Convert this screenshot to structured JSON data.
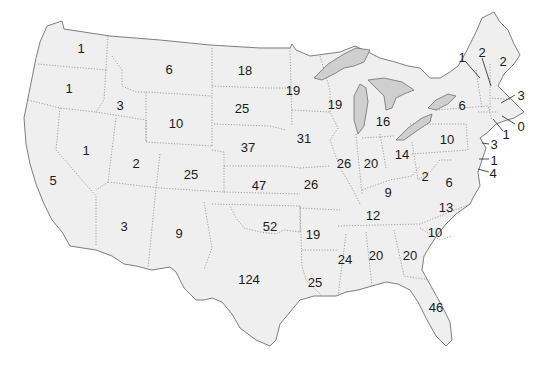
{
  "map": {
    "type": "us-states-count-map",
    "background": "#ffffff",
    "land_color": "#efefef",
    "lake_color": "#cfcfcf",
    "labels": [
      {
        "state": "WA",
        "value": "1",
        "x": 81,
        "y": 48
      },
      {
        "state": "OR",
        "value": "1",
        "x": 69,
        "y": 88
      },
      {
        "state": "CA",
        "value": "5",
        "x": 53,
        "y": 180
      },
      {
        "state": "NV",
        "value": "1",
        "x": 86,
        "y": 150
      },
      {
        "state": "ID",
        "value": "3",
        "x": 120,
        "y": 105
      },
      {
        "state": "MT",
        "value": "6",
        "x": 169,
        "y": 69
      },
      {
        "state": "WY",
        "value": "10",
        "x": 176,
        "y": 123
      },
      {
        "state": "UT",
        "value": "2",
        "x": 136,
        "y": 163
      },
      {
        "state": "AZ",
        "value": "3",
        "x": 124,
        "y": 226
      },
      {
        "state": "CO",
        "value": "25",
        "x": 191,
        "y": 174
      },
      {
        "state": "NM",
        "value": "9",
        "x": 179,
        "y": 233
      },
      {
        "state": "ND",
        "value": "18",
        "x": 245,
        "y": 70
      },
      {
        "state": "SD",
        "value": "25",
        "x": 242,
        "y": 108
      },
      {
        "state": "NE",
        "value": "37",
        "x": 248,
        "y": 147
      },
      {
        "state": "KS",
        "value": "47",
        "x": 259,
        "y": 185
      },
      {
        "state": "OK",
        "value": "52",
        "x": 270,
        "y": 226
      },
      {
        "state": "TX",
        "value": "124",
        "x": 249,
        "y": 279
      },
      {
        "state": "MN",
        "value": "19",
        "x": 293,
        "y": 90
      },
      {
        "state": "IA",
        "value": "31",
        "x": 304,
        "y": 138
      },
      {
        "state": "MO",
        "value": "26",
        "x": 311,
        "y": 184
      },
      {
        "state": "AR",
        "value": "19",
        "x": 313,
        "y": 234
      },
      {
        "state": "LA",
        "value": "25",
        "x": 315,
        "y": 282
      },
      {
        "state": "WI",
        "value": "19",
        "x": 335,
        "y": 104
      },
      {
        "state": "IL",
        "value": "26",
        "x": 344,
        "y": 163
      },
      {
        "state": "MI",
        "value": "16",
        "x": 383,
        "y": 121
      },
      {
        "state": "IN",
        "value": "20",
        "x": 371,
        "y": 163
      },
      {
        "state": "OH",
        "value": "14",
        "x": 402,
        "y": 154
      },
      {
        "state": "KY",
        "value": "9",
        "x": 388,
        "y": 192
      },
      {
        "state": "TN",
        "value": "12",
        "x": 373,
        "y": 215
      },
      {
        "state": "MS",
        "value": "24",
        "x": 345,
        "y": 259
      },
      {
        "state": "AL",
        "value": "20",
        "x": 376,
        "y": 255
      },
      {
        "state": "GA",
        "value": "20",
        "x": 410,
        "y": 255
      },
      {
        "state": "FL",
        "value": "46",
        "x": 436,
        "y": 307
      },
      {
        "state": "SC",
        "value": "10",
        "x": 435,
        "y": 232
      },
      {
        "state": "NC",
        "value": "13",
        "x": 446,
        "y": 207
      },
      {
        "state": "VA",
        "value": "6",
        "x": 449,
        "y": 182
      },
      {
        "state": "WV",
        "value": "2",
        "x": 425,
        "y": 176
      },
      {
        "state": "PA",
        "value": "10",
        "x": 447,
        "y": 139
      },
      {
        "state": "NY",
        "value": "6",
        "x": 462,
        "y": 105
      },
      {
        "state": "VT",
        "value": "1",
        "x": 462,
        "y": 57
      },
      {
        "state": "NH",
        "value": "2",
        "x": 482,
        "y": 52
      },
      {
        "state": "ME",
        "value": "2",
        "x": 503,
        "y": 61
      },
      {
        "state": "MA",
        "value": "3",
        "x": 521,
        "y": 95
      },
      {
        "state": "RI",
        "value": "0",
        "x": 521,
        "y": 126
      },
      {
        "state": "CT",
        "value": "1",
        "x": 506,
        "y": 134
      },
      {
        "state": "NJ",
        "value": "3",
        "x": 494,
        "y": 144
      },
      {
        "state": "DE",
        "value": "1",
        "x": 494,
        "y": 160
      },
      {
        "state": "MD",
        "value": "4",
        "x": 493,
        "y": 173
      }
    ]
  }
}
